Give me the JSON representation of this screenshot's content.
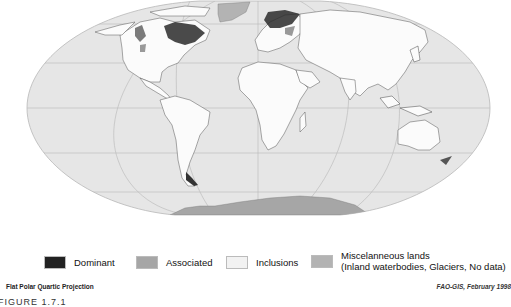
{
  "map": {
    "projection_label": "Flat Polar Quartic Projection",
    "credit": "FAO-GIS, February 1998",
    "figure_label": "FIGURE 1.7.1",
    "colors": {
      "ocean": "#e6e6e6",
      "graticule": "#bdbdbd",
      "land_inclusions": "#fbfbfb",
      "dominant": "#222222",
      "associated": "#a6a6a6",
      "misc": "#b3b3b3"
    }
  },
  "legend": {
    "items": [
      {
        "label": "Dominant",
        "color": "#222222"
      },
      {
        "label": "Associated",
        "color": "#a6a6a6"
      },
      {
        "label": "Inclusions",
        "color": "#f2f2f2"
      },
      {
        "label": "Miscelanneous lands",
        "label_line2": "(Inland waterbodies, Glaciers, No data)",
        "color": "#b3b3b3"
      }
    ]
  }
}
